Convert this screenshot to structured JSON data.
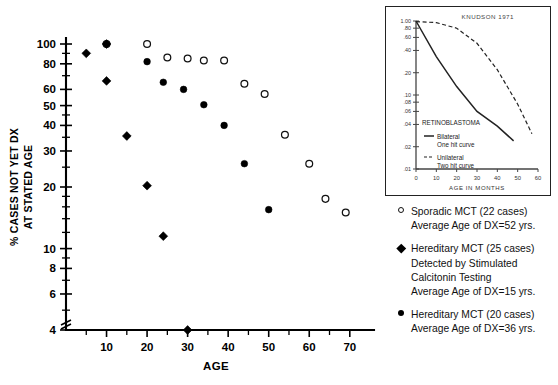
{
  "chart_data": {
    "type": "scatter",
    "title": "",
    "xlabel": "AGE",
    "ylabel": "% CASES NOT YET DX AT STATED AGE",
    "yscale": "log",
    "ylim": [
      4,
      100
    ],
    "xlim": [
      0,
      74
    ],
    "grid": false,
    "legend_position": "right",
    "y_ticks": [
      100,
      80,
      60,
      50,
      40,
      30,
      20,
      10,
      8,
      6,
      4
    ],
    "x_ticks": [
      10,
      20,
      30,
      40,
      50,
      60,
      70
    ],
    "axis_break": "y-axis broken below 4",
    "series": [
      {
        "name": "Sporadic MCT (22 cases)",
        "marker": "open-circle",
        "average_age_of_dx": 52,
        "cases": 22,
        "points": [
          [
            10,
            100
          ],
          [
            20,
            100
          ],
          [
            25,
            86
          ],
          [
            30,
            85
          ],
          [
            34,
            83
          ],
          [
            39,
            83
          ],
          [
            44,
            64
          ],
          [
            49,
            57
          ],
          [
            54,
            36
          ],
          [
            60,
            26
          ],
          [
            64,
            17.5
          ],
          [
            69,
            15
          ]
        ]
      },
      {
        "name": "Hereditary MCT (25 cases) Detected by Stimulated Calcitonin Testing",
        "marker": "filled-diamond",
        "average_age_of_dx": 15,
        "cases": 25,
        "points": [
          [
            5,
            90
          ],
          [
            10,
            100
          ],
          [
            10,
            66
          ],
          [
            15,
            35.5
          ],
          [
            20,
            20.3
          ],
          [
            24,
            11.5
          ],
          [
            30,
            4
          ]
        ]
      },
      {
        "name": "Hereditary MCT (20 cases)",
        "marker": "filled-circle",
        "average_age_of_dx": 36,
        "cases": 20,
        "points": [
          [
            20,
            82
          ],
          [
            24,
            65
          ],
          [
            29,
            60
          ],
          [
            34,
            50.5
          ],
          [
            39,
            40
          ],
          [
            44,
            26
          ],
          [
            50,
            15.5
          ]
        ]
      }
    ]
  },
  "inset_chart": {
    "type": "line",
    "title": "KNUDSON  1971",
    "subject": "RETINOBLASTOMA",
    "xlabel": "AGE  IN  MONTHS",
    "yscale": "log",
    "ylim": [
      0.01,
      1.0
    ],
    "xlim": [
      0,
      60
    ],
    "y_ticks": [
      "1.00",
      ".80",
      ".60",
      ".40",
      ".20",
      ".10",
      ".08",
      ".06",
      ".04",
      ".02",
      ".01"
    ],
    "x_ticks": [
      0,
      10,
      20,
      30,
      40,
      50,
      60
    ],
    "series": [
      {
        "name": "Bilateral",
        "sublabel": "One hit curve",
        "style": "solid",
        "points": [
          [
            0,
            1.0
          ],
          [
            10,
            0.33
          ],
          [
            20,
            0.13
          ],
          [
            30,
            0.06
          ],
          [
            40,
            0.038
          ],
          [
            48,
            0.024
          ]
        ]
      },
      {
        "name": "Unilateral",
        "sublabel": "Two hit curve",
        "style": "dashed",
        "points": [
          [
            0,
            0.98
          ],
          [
            10,
            0.95
          ],
          [
            20,
            0.8
          ],
          [
            30,
            0.5
          ],
          [
            40,
            0.22
          ],
          [
            50,
            0.075
          ],
          [
            57,
            0.03
          ]
        ]
      }
    ]
  },
  "legend": {
    "entries": [
      {
        "marker": "open-circle",
        "lines": [
          "Sporadic MCT (22 cases)",
          "Average Age of DX=52 yrs."
        ]
      },
      {
        "marker": "filled-diamond",
        "lines": [
          "Hereditary MCT (25 cases)",
          "Detected by Stimulated",
          "Calcitonin Testing",
          "Average Age of DX=15 yrs."
        ]
      },
      {
        "marker": "filled-circle",
        "lines": [
          "Hereditary MCT (20 cases)",
          "Average Age of  DX=36 yrs."
        ]
      }
    ]
  }
}
